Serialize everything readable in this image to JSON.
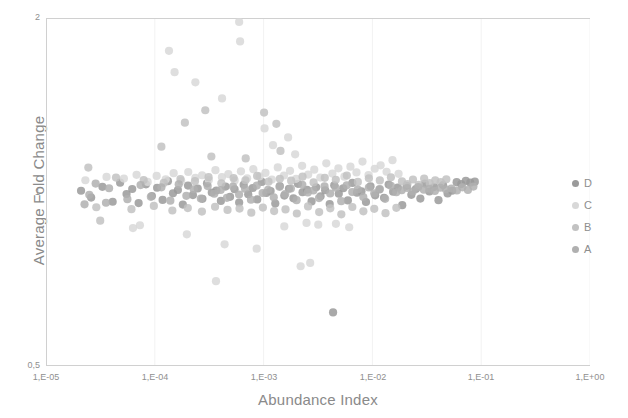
{
  "chart_data": {
    "type": "scatter",
    "title": "",
    "xlabel": "Abundance Index",
    "ylabel": "Average Fold Change",
    "xscale": "log",
    "yscale": "log",
    "xlim": [
      1e-05,
      1.0
    ],
    "ylim": [
      0.5,
      2.0
    ],
    "grid": true,
    "grid_axis": "x",
    "legend_position": "right",
    "xticks": [
      "1,E-05",
      "1,E-04",
      "1,E-03",
      "1,E-02",
      "1,E-01",
      "1,E+00"
    ],
    "xtick_values": [
      1e-05,
      0.0001,
      0.001,
      0.01,
      0.1,
      1
    ],
    "yticks": [
      "0,5",
      "1",
      "2"
    ],
    "ytick_values": [
      0.5,
      1,
      2
    ],
    "marker_size": 5,
    "series": [
      {
        "name": "D",
        "color": "#9a9a9a",
        "points": [
          [
            2.1e-05,
            1.005
          ],
          [
            2.6e-05,
            0.978
          ],
          [
            3.3e-05,
            1.021
          ],
          [
            4.1e-05,
            0.962
          ],
          [
            4.8e-05,
            1.038
          ],
          [
            5.5e-05,
            0.992
          ],
          [
            6.2e-05,
            1.012
          ],
          [
            7.1e-05,
            0.957
          ],
          [
            8.3e-05,
            1.031
          ],
          [
            9.4e-05,
            0.984
          ],
          [
            0.000105,
            1.017
          ],
          [
            0.000118,
            0.969
          ],
          [
            0.000132,
            1.044
          ],
          [
            0.000147,
            0.995
          ],
          [
            0.000163,
            1.008
          ],
          [
            0.000181,
            0.951
          ],
          [
            0.000202,
            1.026
          ],
          [
            0.000224,
            0.988
          ],
          [
            0.000248,
            1.014
          ],
          [
            0.000274,
            0.973
          ],
          [
            0.000302,
            1.035
          ],
          [
            0.000334,
            0.998
          ],
          [
            0.000368,
            1.006
          ],
          [
            0.000405,
            0.965
          ],
          [
            0.000447,
            1.022
          ],
          [
            0.000492,
            0.981
          ],
          [
            0.000541,
            1.011
          ],
          [
            0.000596,
            0.959
          ],
          [
            0.000656,
            1.029
          ],
          [
            0.000722,
            0.991
          ],
          [
            0.000794,
            1.016
          ],
          [
            0.000874,
            0.971
          ],
          [
            0.000962,
            1.041
          ],
          [
            0.00106,
            0.996
          ],
          [
            0.00116,
            1.004
          ],
          [
            0.00128,
            0.955
          ],
          [
            0.00141,
            1.024
          ],
          [
            0.00155,
            0.986
          ],
          [
            0.00171,
            1.013
          ],
          [
            0.00188,
            0.975
          ],
          [
            0.00207,
            1.033
          ],
          [
            0.00228,
            0.999
          ],
          [
            0.00251,
            1.009
          ],
          [
            0.00276,
            0.963
          ],
          [
            0.00304,
            1.019
          ],
          [
            0.00334,
            0.983
          ],
          [
            0.00368,
            1.007
          ],
          [
            0.00405,
            0.953
          ],
          [
            0.00446,
            1.027
          ],
          [
            0.00491,
            0.993
          ],
          [
            0.0054,
            1.015
          ],
          [
            0.00595,
            0.967
          ],
          [
            0.00655,
            1.037
          ],
          [
            0.00721,
            0.997
          ],
          [
            0.00793,
            1.003
          ],
          [
            0.00873,
            0.961
          ],
          [
            0.00961,
            1.023
          ],
          [
            0.0106,
            0.987
          ],
          [
            0.0116,
            1.01
          ],
          [
            0.0128,
            0.977
          ],
          [
            0.0141,
            1.03
          ],
          [
            0.0155,
            1.001
          ],
          [
            0.0171,
            1.018
          ],
          [
            0.0188,
            0.949
          ],
          [
            0.0207,
            1.025
          ],
          [
            0.0228,
            0.989
          ],
          [
            0.0251,
            1.012
          ],
          [
            0.0276,
            0.974
          ],
          [
            0.0304,
            1.034
          ],
          [
            0.0334,
            1.002
          ],
          [
            0.0368,
            1.02
          ],
          [
            0.0405,
            0.968
          ],
          [
            0.0446,
            1.028
          ],
          [
            0.0491,
            0.994
          ],
          [
            0.0541,
            1.005
          ],
          [
            0.0595,
            1.04
          ],
          [
            0.0656,
            1.032
          ],
          [
            0.0722,
            1.045
          ],
          [
            0.0794,
            1.038
          ],
          [
            0.0874,
            1.042
          ],
          [
            0.00435,
            0.619
          ]
        ]
      },
      {
        "name": "C",
        "color": "#d8d8d8",
        "points": [
          [
            2.3e-05,
            1.048
          ],
          [
            3.6e-05,
            1.062
          ],
          [
            5.2e-05,
            1.055
          ],
          [
            6.8e-05,
            1.071
          ],
          [
            8.6e-05,
            1.041
          ],
          [
            0.000104,
            1.066
          ],
          [
            0.000126,
            1.052
          ],
          [
            0.000149,
            1.078
          ],
          [
            0.000175,
            1.045
          ],
          [
            0.000203,
            1.083
          ],
          [
            0.000236,
            1.058
          ],
          [
            0.000272,
            1.069
          ],
          [
            0.000314,
            1.049
          ],
          [
            0.000361,
            1.091
          ],
          [
            0.000414,
            1.061
          ],
          [
            0.000474,
            1.074
          ],
          [
            0.000542,
            1.047
          ],
          [
            0.000619,
            1.086
          ],
          [
            0.000706,
            1.056
          ],
          [
            0.000805,
            1.095
          ],
          [
            0.000917,
            1.064
          ],
          [
            0.00104,
            1.079
          ],
          [
            0.00119,
            1.051
          ],
          [
            0.00135,
            1.103
          ],
          [
            0.00154,
            1.068
          ],
          [
            0.00175,
            1.088
          ],
          [
            0.00199,
            1.054
          ],
          [
            0.00226,
            1.11
          ],
          [
            0.00257,
            1.072
          ],
          [
            0.00292,
            1.093
          ],
          [
            0.00332,
            1.059
          ],
          [
            0.00377,
            1.121
          ],
          [
            0.00429,
            1.076
          ],
          [
            0.00487,
            1.099
          ],
          [
            0.00553,
            1.063
          ],
          [
            0.00628,
            1.106
          ],
          [
            0.00714,
            1.081
          ],
          [
            0.00811,
            1.129
          ],
          [
            0.00921,
            1.07
          ],
          [
            0.0105,
            1.097
          ],
          [
            0.0119,
            1.112
          ],
          [
            0.0135,
            1.084
          ],
          [
            0.0153,
            1.135
          ],
          [
            0.0174,
            1.075
          ],
          [
            0.000135,
            1.755
          ],
          [
            0.000152,
            1.612
          ],
          [
            0.000236,
            1.548
          ],
          [
            0.000415,
            1.452
          ],
          [
            0.000596,
            1.969
          ],
          [
            0.000608,
            1.822
          ],
          [
            0.00102,
            1.288
          ],
          [
            0.00122,
            1.205
          ],
          [
            0.00168,
            1.243
          ],
          [
            0.00195,
            1.162
          ],
          [
            7.3e-05,
            0.876
          ],
          [
            0.000197,
            0.845
          ],
          [
            0.000438,
            0.812
          ],
          [
            0.000864,
            0.798
          ],
          [
            0.00155,
            0.872
          ],
          [
            0.00248,
            0.884
          ],
          [
            0.00318,
            0.878
          ],
          [
            0.00462,
            0.881
          ],
          [
            0.00612,
            0.869
          ],
          [
            0.000365,
            0.701
          ],
          [
            6.3e-05,
            0.866
          ],
          [
            0.00219,
            0.744
          ],
          [
            0.00268,
            0.754
          ]
        ]
      },
      {
        "name": "B",
        "color": "#c2c2c2",
        "points": [
          [
            2.9e-05,
            0.941
          ],
          [
            4.4e-05,
            1.059
          ],
          [
            6.1e-05,
            0.934
          ],
          [
            7.9e-05,
            1.049
          ],
          [
            9.8e-05,
            0.946
          ],
          [
            0.000121,
            1.037
          ],
          [
            0.000145,
            0.929
          ],
          [
            0.000172,
            1.053
          ],
          [
            0.000201,
            0.938
          ],
          [
            0.000234,
            1.044
          ],
          [
            0.000271,
            0.925
          ],
          [
            0.000312,
            1.061
          ],
          [
            0.000358,
            0.943
          ],
          [
            0.000409,
            1.035
          ],
          [
            0.000466,
            0.931
          ],
          [
            0.00053,
            1.057
          ],
          [
            0.000601,
            0.936
          ],
          [
            0.000681,
            1.048
          ],
          [
            0.000771,
            0.921
          ],
          [
            0.000872,
            1.066
          ],
          [
            0.000985,
            0.94
          ],
          [
            0.00111,
            1.042
          ],
          [
            0.00125,
            0.927
          ],
          [
            0.00141,
            1.054
          ],
          [
            0.00159,
            0.933
          ],
          [
            0.00179,
            1.046
          ],
          [
            0.00202,
            0.918
          ],
          [
            0.00228,
            1.063
          ],
          [
            0.00256,
            0.944
          ],
          [
            0.00288,
            1.039
          ],
          [
            0.00324,
            0.923
          ],
          [
            0.00365,
            1.058
          ],
          [
            0.0041,
            0.937
          ],
          [
            0.00461,
            1.05
          ],
          [
            0.00518,
            0.915
          ],
          [
            0.00582,
            1.068
          ],
          [
            0.00654,
            0.942
          ],
          [
            0.00735,
            1.041
          ],
          [
            0.00826,
            0.926
          ],
          [
            0.00928,
            1.056
          ],
          [
            0.0104,
            0.935
          ],
          [
            0.0117,
            1.047
          ],
          [
            0.0132,
            0.919
          ],
          [
            0.0148,
            1.06
          ],
          [
            0.0166,
            0.939
          ],
          [
            0.0187,
            1.043
          ],
          [
            0.021,
            1.032
          ],
          [
            0.0236,
            1.051
          ],
          [
            0.0266,
            1.029
          ],
          [
            0.0299,
            1.055
          ],
          [
            0.0336,
            1.036
          ],
          [
            0.0378,
            1.048
          ],
          [
            0.0425,
            1.04
          ],
          [
            0.0478,
            1.052
          ],
          [
            0.000189,
            1.318
          ],
          [
            0.000291,
            1.385
          ],
          [
            0.00101,
            1.372
          ],
          [
            0.00131,
            1.312
          ],
          [
            0.00143,
            1.178
          ],
          [
            0.000115,
            1.198
          ],
          [
            0.000331,
            1.152
          ],
          [
            0.000685,
            1.143
          ],
          [
            2.45e-05,
            1.102
          ],
          [
            3.15e-05,
            0.892
          ]
        ]
      },
      {
        "name": "A",
        "color": "#b0b0b0",
        "points": [
          [
            2.5e-05,
            0.989
          ],
          [
            3.8e-05,
            1.015
          ],
          [
            5.6e-05,
            0.972
          ],
          [
            7.4e-05,
            1.028
          ],
          [
            9.2e-05,
            0.981
          ],
          [
            0.000115,
            1.019
          ],
          [
            0.000139,
            0.966
          ],
          [
            0.000166,
            1.031
          ],
          [
            0.000195,
            0.985
          ],
          [
            0.000228,
            1.011
          ],
          [
            0.000265,
            0.974
          ],
          [
            0.000306,
            1.024
          ],
          [
            0.000352,
            0.993
          ],
          [
            0.000403,
            1.008
          ],
          [
            0.00046,
            0.977
          ],
          [
            0.000524,
            1.022
          ],
          [
            0.000595,
            0.99
          ],
          [
            0.000675,
            1.013
          ],
          [
            0.000765,
            0.97
          ],
          [
            0.000866,
            1.026
          ],
          [
            0.000979,
            0.996
          ],
          [
            0.0011,
            1.009
          ],
          [
            0.00124,
            0.979
          ],
          [
            0.0014,
            1.021
          ],
          [
            0.00158,
            0.992
          ],
          [
            0.00178,
            1.014
          ],
          [
            0.00201,
            0.968
          ],
          [
            0.00227,
            1.029
          ],
          [
            0.00255,
            0.998
          ],
          [
            0.00287,
            1.006
          ],
          [
            0.00323,
            0.976
          ],
          [
            0.00363,
            1.023
          ],
          [
            0.00409,
            0.994
          ],
          [
            0.0046,
            1.017
          ],
          [
            0.00517,
            0.964
          ],
          [
            0.00581,
            1.027
          ],
          [
            0.00653,
            1.0
          ],
          [
            0.00734,
            1.01
          ],
          [
            0.00825,
            0.98
          ],
          [
            0.00927,
            1.018
          ],
          [
            0.0104,
            0.995
          ],
          [
            0.0117,
            1.012
          ],
          [
            0.0131,
            0.973
          ],
          [
            0.0148,
            1.025
          ],
          [
            0.0166,
            0.999
          ],
          [
            0.0186,
            1.007
          ],
          [
            0.0209,
            1.016
          ],
          [
            0.0235,
            1.002
          ],
          [
            0.0264,
            1.02
          ],
          [
            0.0297,
            1.009
          ],
          [
            0.0334,
            1.013
          ],
          [
            0.0375,
            1.004
          ],
          [
            0.0421,
            1.017
          ],
          [
            0.0473,
            1.011
          ],
          [
            0.0532,
            1.014
          ],
          [
            0.0598,
            1.006
          ],
          [
            0.0672,
            1.019
          ],
          [
            0.0755,
            1.008
          ],
          [
            0.0848,
            1.022
          ],
          [
            2.26e-05,
            0.952
          ],
          [
            2.86e-05,
            1.034
          ],
          [
            3.56e-05,
            0.958
          ]
        ]
      }
    ]
  },
  "legend": {
    "items": [
      {
        "label": "D",
        "color": "#9a9a9a"
      },
      {
        "label": "C",
        "color": "#d8d8d8"
      },
      {
        "label": "B",
        "color": "#c2c2c2"
      },
      {
        "label": "A",
        "color": "#b0b0b0"
      }
    ]
  },
  "style": {
    "axis_line_color": "#d0d0d0",
    "gridline_color": "#f2f2f2",
    "tick_text_color": "#8f8f8f",
    "axis_title_color": "#8a8a8a",
    "plot_background": "#ffffff"
  }
}
